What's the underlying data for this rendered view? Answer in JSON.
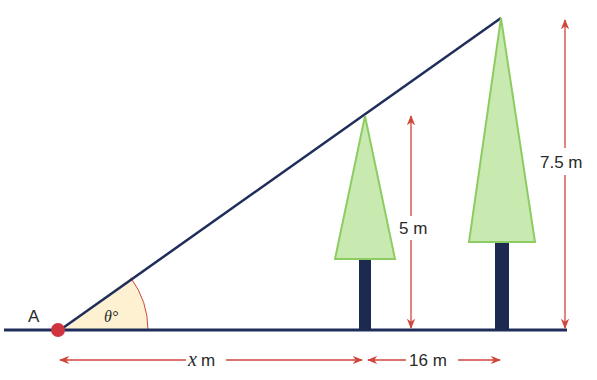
{
  "diagram": {
    "point_label": "A",
    "angle_label": "θ°",
    "dimensions": {
      "horizontal_x": {
        "var": "x",
        "unit": "m"
      },
      "horizontal_gap": "16 m",
      "short_tree_height": "5 m",
      "tall_tree_height": "7.5 m"
    },
    "colors": {
      "line": "#1f2d5a",
      "arrow": "#d0463a",
      "point": "#d0343f",
      "tree_fill": "#c8eab0",
      "tree_stroke": "#8ccc62",
      "trunk": "#1c2a50",
      "angle_fill": "#fdf1d2"
    }
  }
}
